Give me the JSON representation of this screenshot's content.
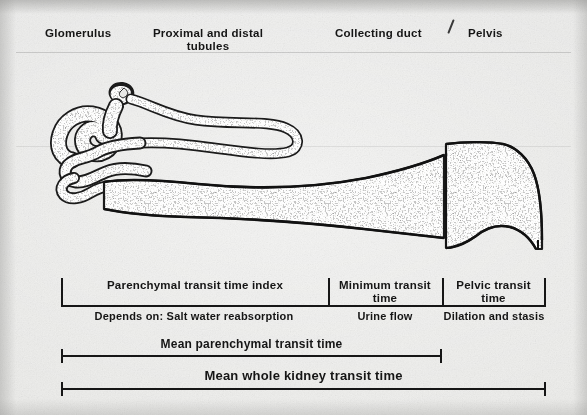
{
  "figure": {
    "type": "medical-diagram",
    "background_color": "#ebebe9",
    "ink_color": "#161616",
    "stipple_color": "#8a8a88"
  },
  "anatomy_labels": [
    {
      "id": "glomerulus",
      "text": "Glomerulus",
      "x": 45,
      "y": 27,
      "width": 80,
      "align": "left"
    },
    {
      "id": "tubules",
      "text": "Proximal and distal\ntubules",
      "x": 152,
      "y": 27,
      "width": 112,
      "align": "center"
    },
    {
      "id": "collecting",
      "text": "Collecting duct",
      "x": 335,
      "y": 27,
      "width": 100,
      "align": "left"
    },
    {
      "id": "pelvis",
      "text": "Pelvis",
      "x": 468,
      "y": 27,
      "width": 60,
      "align": "left"
    }
  ],
  "scale": {
    "segments": [
      {
        "id": "parenchymal-transit-time-index",
        "label": "Parenchymal transit time index",
        "sub_label": "Depends on: Salt water reabsorption",
        "x_start": 61,
        "x_end": 328
      },
      {
        "id": "minimum-transit-time",
        "label": "Minimum transit\ntime",
        "sub_label": "Urine flow",
        "x_start": 328,
        "x_end": 442
      },
      {
        "id": "pelvic-transit-time",
        "label": "Pelvic transit\ntime",
        "sub_label": "Dilation and stasis",
        "x_start": 442,
        "x_end": 545
      }
    ],
    "bars": [
      {
        "id": "mean-parenchymal-transit-time",
        "label": "Mean parenchymal transit time",
        "x_start": 61,
        "x_end": 442,
        "y": 355
      },
      {
        "id": "mean-whole-kidney-transit-time",
        "label": "Mean whole kidney transit time",
        "x_start": 61,
        "x_end": 545,
        "y": 388
      }
    ]
  },
  "diagram_parts": [
    {
      "id": "glomerulus-capsule",
      "name": "glomerulus"
    },
    {
      "id": "proximal-distal-tubule",
      "name": "proximal and distal convoluted tubules"
    },
    {
      "id": "loop-of-henle-descending",
      "name": "descending limb"
    },
    {
      "id": "loop-of-henle-bend",
      "name": "loop bend"
    },
    {
      "id": "loop-of-henle-ascending",
      "name": "ascending limb"
    },
    {
      "id": "collecting-duct-body",
      "name": "collecting duct"
    },
    {
      "id": "renal-pelvis-body",
      "name": "renal pelvis"
    }
  ]
}
